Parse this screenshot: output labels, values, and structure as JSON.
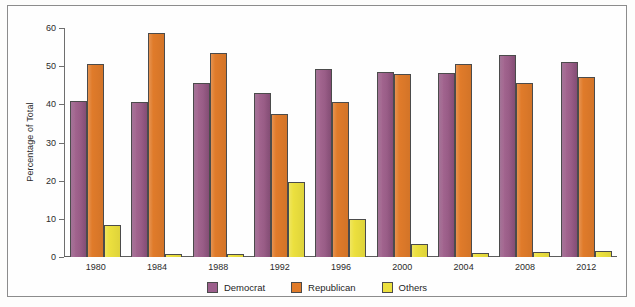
{
  "chart_data": {
    "type": "bar",
    "title": "",
    "xlabel": "",
    "ylabel": "Percentage of Total",
    "ylim": [
      0,
      60
    ],
    "yticks": [
      0,
      10,
      20,
      30,
      40,
      50,
      60
    ],
    "grid": false,
    "legend_position": "bottom",
    "categories": [
      "1980",
      "1984",
      "1988",
      "1992",
      "1996",
      "2000",
      "2004",
      "2008",
      "2012"
    ],
    "series": [
      {
        "name": "Democrat",
        "color": "#9c5f8c",
        "values": [
          41.0,
          40.6,
          45.6,
          43.0,
          49.2,
          48.4,
          48.3,
          52.9,
          51.1
        ]
      },
      {
        "name": "Republican",
        "color": "#e07b2a",
        "values": [
          50.7,
          58.8,
          53.4,
          37.4,
          40.7,
          47.9,
          50.7,
          45.7,
          47.2
        ]
      },
      {
        "name": "Others",
        "color": "#ece03e",
        "values": [
          8.4,
          0.7,
          0.9,
          19.7,
          10.0,
          3.5,
          1.0,
          1.4,
          1.7
        ]
      }
    ]
  },
  "legend": {
    "items": [
      {
        "label": "Democrat",
        "color": "#9c5f8c"
      },
      {
        "label": "Republican",
        "color": "#e07b2a"
      },
      {
        "label": "Others",
        "color": "#ece03e"
      }
    ]
  }
}
